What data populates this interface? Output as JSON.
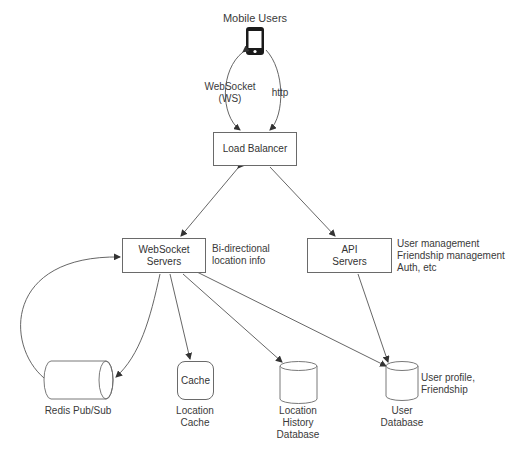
{
  "diagram": {
    "nodes": {
      "mobile_users": {
        "label": "Mobile Users",
        "icon": "smartphone-icon"
      },
      "load_balancer": {
        "label": "Load Balancer"
      },
      "websocket_servers": {
        "label_line1": "WebSocket",
        "label_line2": "Servers"
      },
      "api_servers": {
        "label_line1": "API",
        "label_line2": "Servers"
      },
      "redis": {
        "label": "Redis Pub/Sub"
      },
      "cache": {
        "inner": "Cache",
        "label_line1": "Location",
        "label_line2": "Cache"
      },
      "location_history_db": {
        "label_line1": "Location",
        "label_line2": "History",
        "label_line3": "Database"
      },
      "user_db": {
        "label_line1": "User",
        "label_line2": "Database"
      }
    },
    "annotations": {
      "ws_line1": "WebSocket",
      "ws_line2": "(WS)",
      "http": "http",
      "ws_servers_note_line1": "Bi-directional",
      "ws_servers_note_line2": "location info",
      "api_note_line1": "User management",
      "api_note_line2": "Friendship management",
      "api_note_line3": "Auth, etc",
      "userdb_note_line1": "User profile,",
      "userdb_note_line2": "Friendship"
    },
    "edges": [
      {
        "from": "mobile_users",
        "to": "load_balancer",
        "label": "WebSocket (WS)",
        "bidirectional": true
      },
      {
        "from": "mobile_users",
        "to": "load_balancer",
        "label": "http"
      },
      {
        "from": "load_balancer",
        "to": "websocket_servers",
        "bidirectional": true
      },
      {
        "from": "load_balancer",
        "to": "api_servers"
      },
      {
        "from": "websocket_servers",
        "to": "redis",
        "bidirectional": true
      },
      {
        "from": "websocket_servers",
        "to": "cache"
      },
      {
        "from": "websocket_servers",
        "to": "location_history_db"
      },
      {
        "from": "websocket_servers",
        "to": "user_db"
      },
      {
        "from": "api_servers",
        "to": "user_db"
      }
    ],
    "colors": {
      "line": "#555555",
      "box_border": "#6a6a6a",
      "text": "#333333"
    }
  }
}
